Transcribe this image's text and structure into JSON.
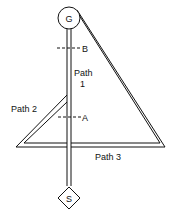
{
  "diagram": {
    "type": "path-network",
    "nodes": {
      "goal": {
        "label": "G",
        "shape": "circle"
      },
      "start": {
        "label": "S",
        "shape": "diamond"
      }
    },
    "paths": [
      {
        "id": "path1",
        "label_line1": "Path",
        "label_line2": "1"
      },
      {
        "id": "path2",
        "label": "Path 2"
      },
      {
        "id": "path3",
        "label": "Path 3"
      }
    ],
    "markers": [
      {
        "id": "B",
        "label": "B"
      },
      {
        "id": "A",
        "label": "A"
      }
    ],
    "colors": {
      "line": "#111111",
      "background": "#ffffff"
    }
  }
}
